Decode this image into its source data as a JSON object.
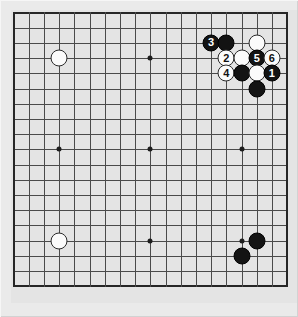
{
  "board": {
    "title": "Go game diagram",
    "size": 19,
    "origin_x": 2.5,
    "origin_y": 2.5,
    "spacing": 15.2,
    "background_color": "#e4e4e4",
    "line_color": "#4a4a4a",
    "edge_color": "#262626",
    "black_color": "#131313",
    "white_color": "#fbfbfb",
    "star_points": [
      {
        "col": 4,
        "row": 4
      },
      {
        "col": 10,
        "row": 4
      },
      {
        "col": 16,
        "row": 4
      },
      {
        "col": 4,
        "row": 10
      },
      {
        "col": 10,
        "row": 10
      },
      {
        "col": 16,
        "row": 10
      },
      {
        "col": 4,
        "row": 16
      },
      {
        "col": 10,
        "row": 16
      },
      {
        "col": 16,
        "row": 16
      }
    ],
    "stones": [
      {
        "col": 4,
        "row": 4,
        "color": "white",
        "label": ""
      },
      {
        "col": 4,
        "row": 16,
        "color": "white",
        "label": ""
      },
      {
        "col": 16,
        "row": 17,
        "color": "black",
        "label": ""
      },
      {
        "col": 17,
        "row": 16,
        "color": "black",
        "label": ""
      },
      {
        "col": 14,
        "row": 3,
        "color": "black",
        "label": "3"
      },
      {
        "col": 15,
        "row": 3,
        "color": "black",
        "label": ""
      },
      {
        "col": 17,
        "row": 3,
        "color": "white",
        "label": ""
      },
      {
        "col": 15,
        "row": 4,
        "color": "white",
        "label": "2"
      },
      {
        "col": 16,
        "row": 4,
        "color": "white",
        "label": ""
      },
      {
        "col": 17,
        "row": 4,
        "color": "black",
        "label": "5"
      },
      {
        "col": 18,
        "row": 4,
        "color": "white",
        "label": "6"
      },
      {
        "col": 15,
        "row": 5,
        "color": "white",
        "label": "4"
      },
      {
        "col": 16,
        "row": 5,
        "color": "black",
        "label": ""
      },
      {
        "col": 17,
        "row": 5,
        "color": "white",
        "label": ""
      },
      {
        "col": 18,
        "row": 5,
        "color": "black",
        "label": "1"
      },
      {
        "col": 17,
        "row": 6,
        "color": "black",
        "label": ""
      }
    ]
  }
}
